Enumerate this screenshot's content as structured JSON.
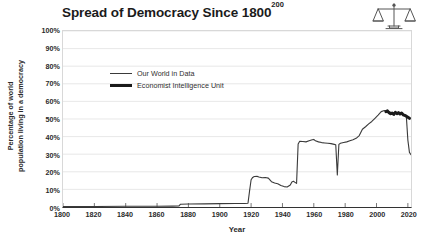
{
  "title": {
    "main": "Spread of Democracy Since 1800",
    "superscript": "200"
  },
  "icon": {
    "name": "balance-scales-icon"
  },
  "axes": {
    "ylabel_line1": "Percentage of world",
    "ylabel_line2": "population living in a democracy",
    "xlabel": "Year"
  },
  "legend": {
    "items": [
      {
        "label": "Our World in Data",
        "style": "thin",
        "color": "#3a3a3a"
      },
      {
        "label": "Economist Intelligence Unit",
        "style": "thick",
        "color": "#1a1a1a"
      }
    ]
  },
  "chart_data": {
    "type": "line",
    "title": "Spread of Democracy Since 1800",
    "xlabel": "Year",
    "ylabel": "Percentage of world population living in a democracy",
    "xlim": [
      1800,
      2022
    ],
    "ylim": [
      0,
      100
    ],
    "xticks": [
      1800,
      1820,
      1840,
      1860,
      1880,
      1900,
      1920,
      1940,
      1960,
      1980,
      2000,
      2020
    ],
    "xtick_labels": [
      "1800",
      "1820",
      "1840",
      "1860",
      "1880",
      "1900",
      "1920",
      "1940",
      "1960",
      "1980",
      "2000",
      "2020"
    ],
    "yticks": [
      0,
      10,
      20,
      30,
      40,
      50,
      60,
      70,
      80,
      90,
      100
    ],
    "ytick_labels": [
      "0%",
      "10%",
      "20%",
      "30%",
      "40%",
      "50%",
      "60%",
      "70%",
      "80%",
      "90%",
      "100%"
    ],
    "grid": true,
    "grid_axis": "y",
    "legend_position": "upper-left-inside",
    "series": [
      {
        "name": "Our World in Data",
        "style": "thin",
        "color": "#3a3a3a",
        "linewidth": 1.1,
        "points": [
          [
            1800,
            0.3
          ],
          [
            1820,
            0.3
          ],
          [
            1840,
            0.4
          ],
          [
            1860,
            0.4
          ],
          [
            1870,
            0.5
          ],
          [
            1874,
            0.6
          ],
          [
            1875,
            1.6
          ],
          [
            1880,
            1.7
          ],
          [
            1890,
            1.8
          ],
          [
            1900,
            1.9
          ],
          [
            1910,
            2.0
          ],
          [
            1916,
            2.0
          ],
          [
            1918,
            2.1
          ],
          [
            1919,
            9.0
          ],
          [
            1920,
            15.5
          ],
          [
            1921,
            16.8
          ],
          [
            1922,
            17.3
          ],
          [
            1924,
            17.4
          ],
          [
            1925,
            17.0
          ],
          [
            1927,
            16.6
          ],
          [
            1929,
            16.8
          ],
          [
            1931,
            16.4
          ],
          [
            1933,
            14.4
          ],
          [
            1935,
            13.6
          ],
          [
            1937,
            13.2
          ],
          [
            1939,
            12.2
          ],
          [
            1941,
            11.6
          ],
          [
            1943,
            11.4
          ],
          [
            1945,
            12.5
          ],
          [
            1946,
            14.2
          ],
          [
            1947,
            14.6
          ],
          [
            1948,
            14.0
          ],
          [
            1949,
            13.4
          ],
          [
            1950,
            35.8
          ],
          [
            1951,
            37.4
          ],
          [
            1953,
            37.2
          ],
          [
            1955,
            37.0
          ],
          [
            1957,
            37.6
          ],
          [
            1959,
            38.2
          ],
          [
            1960,
            38.4
          ],
          [
            1961,
            37.6
          ],
          [
            1963,
            37.0
          ],
          [
            1965,
            36.6
          ],
          [
            1967,
            36.4
          ],
          [
            1969,
            36.2
          ],
          [
            1971,
            36.0
          ],
          [
            1973,
            35.6
          ],
          [
            1974,
            35.4
          ],
          [
            1975,
            18.2
          ],
          [
            1976,
            35.6
          ],
          [
            1977,
            36.2
          ],
          [
            1979,
            36.6
          ],
          [
            1981,
            37.0
          ],
          [
            1983,
            37.6
          ],
          [
            1985,
            38.2
          ],
          [
            1987,
            39.0
          ],
          [
            1989,
            40.6
          ],
          [
            1991,
            44.2
          ],
          [
            1993,
            45.6
          ],
          [
            1995,
            47.2
          ],
          [
            1997,
            48.6
          ],
          [
            1999,
            50.4
          ],
          [
            2001,
            52.2
          ],
          [
            2003,
            54.2
          ],
          [
            2005,
            54.8
          ],
          [
            2007,
            54.4
          ],
          [
            2009,
            53.8
          ],
          [
            2011,
            53.2
          ],
          [
            2013,
            53.6
          ],
          [
            2015,
            53.4
          ],
          [
            2017,
            52.6
          ],
          [
            2018,
            52.2
          ],
          [
            2019,
            51.8
          ],
          [
            2020,
            38.0
          ],
          [
            2021,
            31.0
          ],
          [
            2022,
            29.8
          ]
        ]
      },
      {
        "name": "Economist Intelligence Unit",
        "style": "thick",
        "color": "#1a1a1a",
        "linewidth": 3.0,
        "points": [
          [
            2006,
            54.2
          ],
          [
            2007,
            54.6
          ],
          [
            2008,
            53.6
          ],
          [
            2009,
            53.0
          ],
          [
            2010,
            53.4
          ],
          [
            2011,
            52.6
          ],
          [
            2012,
            53.8
          ],
          [
            2013,
            53.0
          ],
          [
            2014,
            53.6
          ],
          [
            2015,
            52.8
          ],
          [
            2016,
            53.4
          ],
          [
            2017,
            52.4
          ],
          [
            2018,
            52.0
          ],
          [
            2019,
            51.6
          ],
          [
            2020,
            51.0
          ],
          [
            2021,
            50.4
          ]
        ]
      }
    ],
    "annotations": [
      {
        "text": "sharp drop at 1975",
        "x": 1975,
        "y": 18.2
      },
      {
        "text": "post-WWI rise",
        "x": 1920,
        "y": 15.5
      },
      {
        "text": "post-war / decolonisation jump",
        "x": 1950,
        "y": 35.8
      },
      {
        "text": "end-of-series decline",
        "x": 2021,
        "y": 31.0
      }
    ]
  }
}
